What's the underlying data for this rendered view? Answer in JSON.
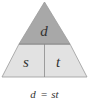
{
  "diagram": {
    "type": "formula-triangle",
    "top": {
      "label": "d",
      "fill": "#a8a8a8"
    },
    "bottom_left": {
      "label": "s",
      "fill": "#e2e2e2"
    },
    "bottom_right": {
      "label": "t",
      "fill": "#e2e2e2"
    },
    "stroke": "#8a8a8a"
  },
  "caption": {
    "lhs": "d",
    "equals": "=",
    "rhs": "st"
  }
}
